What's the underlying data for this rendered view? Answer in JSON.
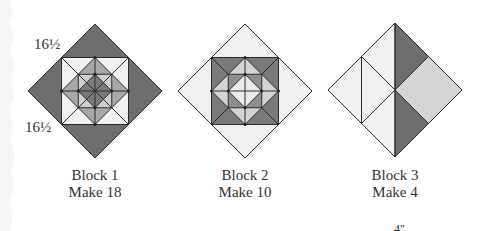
{
  "colors": {
    "dark": "#6e6e6e",
    "medium": "#a3a3a3",
    "light_gray": "#d4d4d4",
    "light": "#f1f1f1",
    "line": "#2a2a2a"
  },
  "dimensions": {
    "top_label": "16½",
    "bottom_label": "16½"
  },
  "blocks": [
    {
      "title": "Block 1",
      "quantity": "Make 18"
    },
    {
      "title": "Block 2",
      "quantity": "Make 10"
    },
    {
      "title": "Block 3",
      "quantity": "Make 4"
    }
  ],
  "footer_fragment": "4\""
}
